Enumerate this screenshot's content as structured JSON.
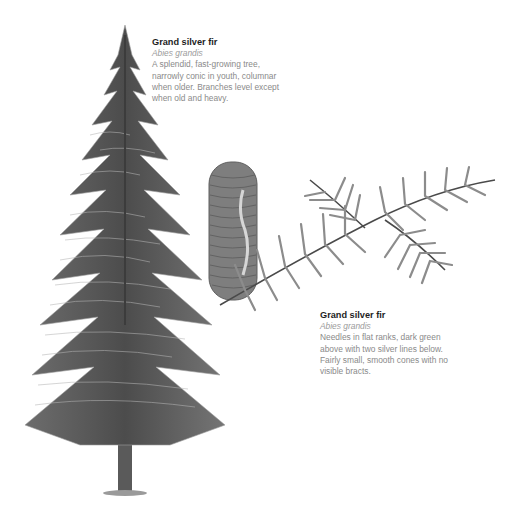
{
  "tree_entry": {
    "title": "Grand silver fir",
    "latin_name": "Abies grandis",
    "description": "A splendid, fast-growing tree, narrowly conic in youth, columnar when older. Branches level except when old and heavy."
  },
  "branch_entry": {
    "title": "Grand silver fir",
    "latin_name": "Abies grandis",
    "description": "Needles in flat ranks, dark green above with two silver lines below. Fairly small, smooth cones with no visible bracts."
  },
  "illustrations": {
    "tree": "whole-tree-illustration",
    "cone": "cone-illustration",
    "branch": "needle-branch-illustration"
  },
  "colors": {
    "title": "#1e1e1e",
    "body_text": "#8a8a8a",
    "foliage_dark": "#4a4a4a",
    "foliage_light": "#8c8c8c"
  }
}
